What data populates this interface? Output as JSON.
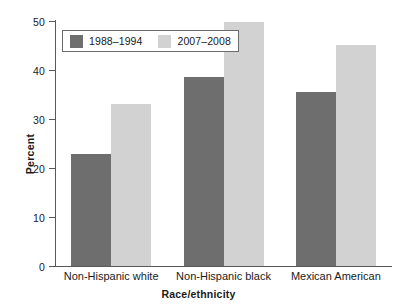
{
  "chart_data": {
    "type": "bar",
    "title": "",
    "subtitle": "",
    "xlabel": "Race/ethnicity",
    "ylabel": "Percent",
    "categories": [
      "Non-Hispanic white",
      "Non-Hispanic black",
      "Mexican American"
    ],
    "series": [
      {
        "name": "1988–1994",
        "color": "#6e6e6e",
        "values": [
          22.8,
          38.5,
          35.5
        ]
      },
      {
        "name": "2007–2008",
        "color": "#d2d2d2",
        "values": [
          33.0,
          49.7,
          45.2
        ]
      }
    ],
    "ylim": [
      0,
      50
    ],
    "yticks": [
      0,
      10,
      20,
      30,
      40,
      50
    ],
    "ytick_labels": [
      "0",
      "10",
      "20",
      "30",
      "40",
      "50"
    ],
    "grid": false,
    "legend_position": "top-left",
    "legend_boxed": true
  },
  "axes": {
    "y_title": "Percent",
    "x_title": "Race/ethnicity"
  }
}
